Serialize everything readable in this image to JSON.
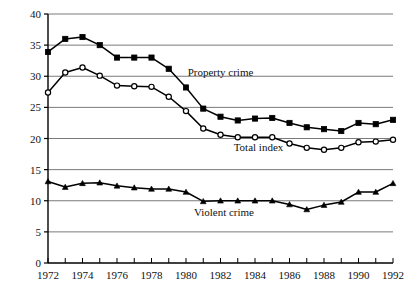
{
  "chart_data": {
    "type": "line",
    "title": "",
    "subtitle": "",
    "xlabel": "",
    "ylabel": "",
    "xlim": [
      1972,
      1992
    ],
    "ylim": [
      0,
      40
    ],
    "grid": true,
    "grid_axis": "y",
    "legend_position": "inline-annotations",
    "x": [
      1972,
      1973,
      1974,
      1975,
      1976,
      1977,
      1978,
      1979,
      1980,
      1981,
      1982,
      1983,
      1984,
      1985,
      1986,
      1987,
      1988,
      1989,
      1990,
      1991,
      1992
    ],
    "y_ticks": [
      0,
      5,
      10,
      15,
      20,
      25,
      30,
      35,
      40
    ],
    "y_tick_labels": [
      "0",
      "5",
      "10",
      "15",
      "20",
      "25",
      "30",
      "35",
      "40"
    ],
    "x_ticks": [
      1972,
      1973,
      1974,
      1975,
      1976,
      1977,
      1978,
      1979,
      1980,
      1981,
      1982,
      1983,
      1984,
      1985,
      1986,
      1987,
      1988,
      1989,
      1990,
      1991,
      1992
    ],
    "x_tick_labels_shown": [
      "1972",
      "1974",
      "1976",
      "1978",
      "1980",
      "1982",
      "1984",
      "1986",
      "1988",
      "1990",
      "1992"
    ],
    "series": [
      {
        "name": "Property crime",
        "marker": "filled-square",
        "color": "#000000",
        "label_text": "Property crime",
        "values": [
          33.9,
          36.0,
          36.3,
          35.0,
          33.0,
          33.0,
          33.0,
          31.2,
          28.2,
          24.8,
          23.5,
          22.9,
          23.2,
          23.3,
          22.5,
          21.8,
          21.5,
          21.2,
          22.5,
          22.3,
          23.0
        ]
      },
      {
        "name": "Total index",
        "marker": "open-circle",
        "color": "#000000",
        "label_text": "Total index",
        "values": [
          27.4,
          30.6,
          31.4,
          30.1,
          28.5,
          28.4,
          28.3,
          26.7,
          24.4,
          21.6,
          20.6,
          20.2,
          20.2,
          20.2,
          19.2,
          18.5,
          18.2,
          18.5,
          19.4,
          19.5,
          19.8
        ]
      },
      {
        "name": "Violent crime",
        "marker": "filled-triangle",
        "color": "#000000",
        "label_text": "Violent crime",
        "values": [
          13.1,
          12.2,
          12.8,
          12.9,
          12.4,
          12.1,
          11.9,
          11.9,
          11.4,
          9.9,
          10.0,
          10.0,
          10.0,
          10.0,
          9.4,
          8.6,
          9.3,
          9.8,
          11.4,
          11.4,
          12.8
        ]
      }
    ],
    "annotations": [
      {
        "name": "property-crime-label",
        "text": "Property crime",
        "x": 1982.0,
        "y": 30.0
      },
      {
        "name": "total-index-label",
        "text": "Total index",
        "x": 1984.2,
        "y": 18.0
      },
      {
        "name": "violent-crime-label",
        "text": "Violent crime",
        "x": 1982.2,
        "y": 7.6
      }
    ],
    "colors": {
      "axis": "#000000",
      "gridline": "#7a7a7a",
      "line": "#000000",
      "background": "#ffffff"
    }
  }
}
